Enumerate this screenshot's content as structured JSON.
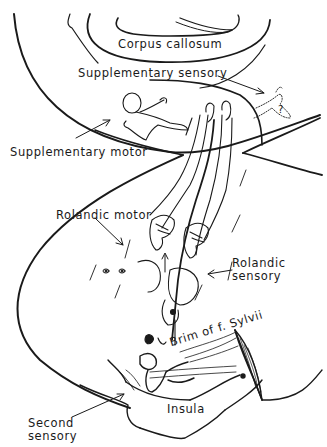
{
  "figure": {
    "type": "anatomical line drawing",
    "colors": {
      "ink": "#1a1a1a",
      "background": "#ffffff"
    }
  },
  "labels": {
    "corpus_callosum": "Corpus callosum",
    "supplementary_sensory": "Supplementary sensory",
    "supplementary_motor": "Supplementary motor",
    "rolandic_motor": "Rolandic motor",
    "rolandic_sensory": "Rolandic\nsensory",
    "brim_sylvii": "Brim of f. Sylvii",
    "insula": "Insula",
    "second_sensory": "Second\nsensory",
    "question_mark": "?"
  }
}
